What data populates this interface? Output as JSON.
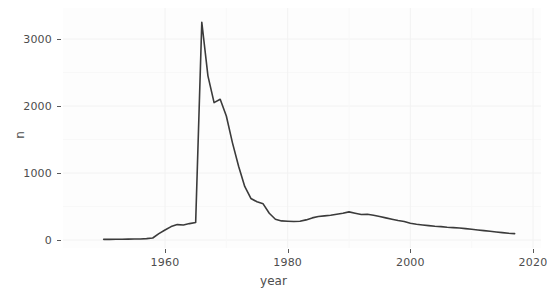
{
  "chart_data": {
    "type": "line",
    "title": "",
    "xlabel": "year",
    "ylabel": "n",
    "xlim": [
      1950,
      2021
    ],
    "ylim": [
      0,
      3400
    ],
    "grid": true,
    "legend": false,
    "x_ticks": [
      1960,
      1980,
      2000,
      2020
    ],
    "x_tick_labels": [
      "1960",
      "1980",
      "2000",
      "2020"
    ],
    "y_ticks": [
      0,
      1000,
      2000,
      3000
    ],
    "y_tick_labels": [
      "0",
      "1000",
      "2000",
      "3000"
    ],
    "series": [
      {
        "name": "n",
        "color": "#3b3b3b",
        "x": [
          1950,
          1951,
          1952,
          1953,
          1954,
          1955,
          1956,
          1957,
          1958,
          1959,
          1960,
          1961,
          1962,
          1963,
          1964,
          1965,
          1966,
          1967,
          1968,
          1969,
          1970,
          1971,
          1972,
          1973,
          1974,
          1975,
          1976,
          1977,
          1978,
          1979,
          1980,
          1981,
          1982,
          1983,
          1984,
          1985,
          1986,
          1987,
          1988,
          1989,
          1990,
          1991,
          1992,
          1993,
          1994,
          1995,
          1996,
          1997,
          1998,
          1999,
          2000,
          2001,
          2002,
          2003,
          2004,
          2005,
          2006,
          2007,
          2008,
          2009,
          2010,
          2011,
          2012,
          2013,
          2014,
          2015,
          2016,
          2017
        ],
        "values": [
          10,
          10,
          11,
          12,
          13,
          14,
          16,
          20,
          30,
          95,
          150,
          200,
          230,
          225,
          245,
          260,
          3250,
          2450,
          2050,
          2100,
          1850,
          1450,
          1100,
          800,
          620,
          570,
          540,
          400,
          310,
          285,
          280,
          275,
          280,
          300,
          330,
          350,
          360,
          370,
          385,
          400,
          420,
          400,
          380,
          385,
          370,
          350,
          330,
          310,
          290,
          275,
          250,
          235,
          225,
          215,
          205,
          200,
          190,
          185,
          180,
          170,
          160,
          150,
          140,
          130,
          120,
          110,
          100,
          95
        ]
      }
    ]
  },
  "axes": {
    "y_title": "n",
    "x_title": "year"
  }
}
